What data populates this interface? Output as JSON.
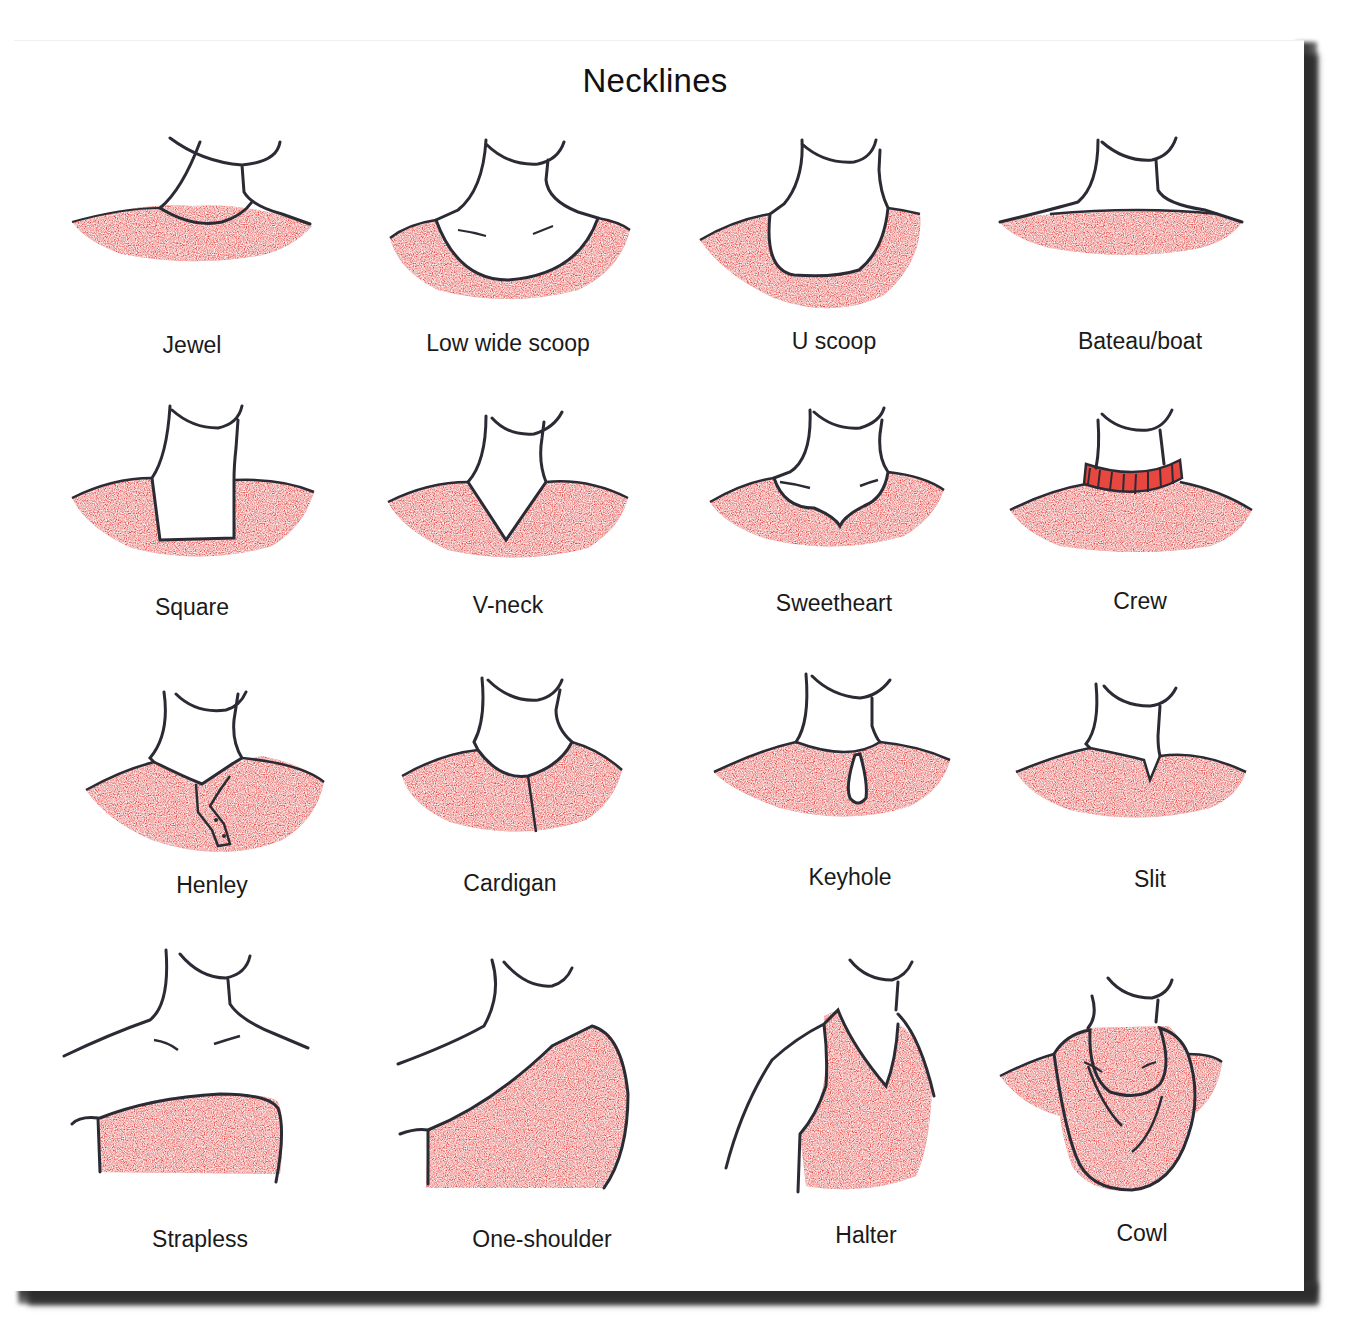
{
  "title": "Necklines",
  "colors": {
    "fabric": "#e8473f",
    "outline": "#2b2b35",
    "background": "#ffffff",
    "shadow": "#3a3a3a"
  },
  "necklines": [
    {
      "label": "Jewel"
    },
    {
      "label": "Low wide scoop"
    },
    {
      "label": "U scoop"
    },
    {
      "label": "Bateau/boat"
    },
    {
      "label": "Square"
    },
    {
      "label": "V-neck"
    },
    {
      "label": "Sweetheart"
    },
    {
      "label": "Crew"
    },
    {
      "label": "Henley"
    },
    {
      "label": "Cardigan"
    },
    {
      "label": "Keyhole"
    },
    {
      "label": "Slit"
    },
    {
      "label": "Strapless"
    },
    {
      "label": "One-shoulder"
    },
    {
      "label": "Halter"
    },
    {
      "label": "Cowl"
    }
  ]
}
